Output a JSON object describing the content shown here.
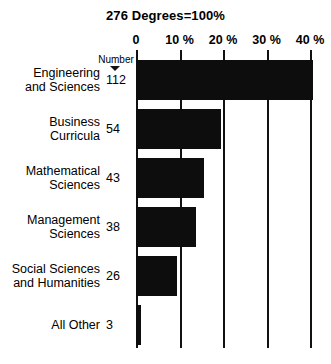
{
  "chart_data": {
    "type": "bar",
    "orientation": "horizontal",
    "title": "276 Degrees=100%",
    "xlabel": "",
    "ylabel": "",
    "xlim": [
      0,
      42
    ],
    "grid": true,
    "legend": null,
    "value_column_header": "Number",
    "categories": [
      "Engineering\nand Sciences",
      "Business\nCurricula",
      "Mathematical\nSciences",
      "Management\nSciences",
      "Social Sciences\nand Humanities",
      "All Other"
    ],
    "counts": [
      112,
      54,
      43,
      38,
      26,
      3
    ],
    "values": [
      40.6,
      19.6,
      15.6,
      13.8,
      9.4,
      1.1
    ],
    "tick_labels": [
      "0",
      "10 %",
      "20 %",
      "30 %",
      "40 %"
    ],
    "tick_values": [
      0,
      10,
      20,
      30,
      40
    ]
  },
  "axis": {
    "ticks": [
      {
        "label": "0",
        "value": 0
      },
      {
        "label": "10 %",
        "value": 10
      },
      {
        "label": "20 %",
        "value": 20
      },
      {
        "label": "30 %",
        "value": 30
      },
      {
        "label": "40 %",
        "value": 40
      }
    ]
  },
  "rows": [
    {
      "name": "Engineering\nand Sciences",
      "count": "112",
      "pct": 40.6
    },
    {
      "name": "Business\nCurricula",
      "count": "54",
      "pct": 19.6
    },
    {
      "name": "Mathematical\nSciences",
      "count": "43",
      "pct": 15.6
    },
    {
      "name": "Management\nSciences",
      "count": "38",
      "pct": 13.8
    },
    {
      "name": "Social Sciences\nand Humanities",
      "count": "26",
      "pct": 9.4
    },
    {
      "name": "All Other",
      "count": "3",
      "pct": 1.1
    }
  ],
  "header": {
    "number_label": "Number"
  },
  "colors": {
    "bar": "#0d0d0d",
    "axis": "#111111",
    "background": "#ffffff",
    "text": "#000000"
  }
}
